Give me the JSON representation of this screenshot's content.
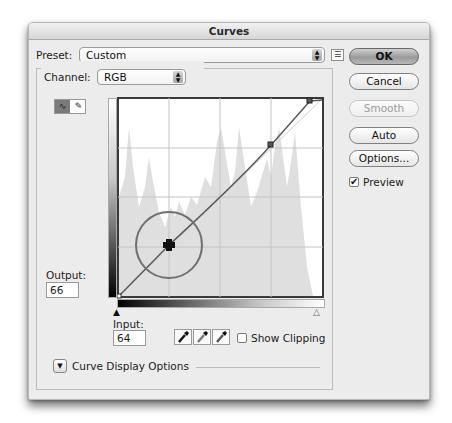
{
  "window": {
    "title": "Curves"
  },
  "preset": {
    "label": "Preset:",
    "value": "Custom",
    "menu_icon": "preset-options-icon"
  },
  "channel": {
    "label": "Channel:",
    "value": "RGB"
  },
  "tools": [
    {
      "name": "curve-edit-tool",
      "glyph": "∿",
      "active": true
    },
    {
      "name": "pencil-tool",
      "glyph": "✎",
      "active": false
    }
  ],
  "buttons": {
    "ok": "OK",
    "cancel": "Cancel",
    "smooth": "Smooth",
    "auto": "Auto",
    "options": "Options..."
  },
  "preview": {
    "label": "Preview",
    "checked": true,
    "glyph": "✔"
  },
  "output": {
    "label": "Output:",
    "value": "66"
  },
  "input": {
    "label": "Input:",
    "value": "64"
  },
  "eyedroppers": [
    {
      "name": "black-point-eyedropper",
      "color": "#111111"
    },
    {
      "name": "gray-point-eyedropper",
      "color": "#777777"
    },
    {
      "name": "white-point-eyedropper",
      "color": "#dddddd"
    }
  ],
  "show_clipping": {
    "label": "Show Clipping",
    "checked": false
  },
  "curve_display_options": {
    "label": "Curve Display Options",
    "glyph": "▼"
  },
  "curve": {
    "points": [
      {
        "input": 0,
        "output": 0
      },
      {
        "input": 64,
        "output": 66,
        "selected": true
      },
      {
        "input": 196,
        "output": 204
      },
      {
        "input": 244,
        "output": 255
      },
      {
        "input": 255,
        "output": 255
      }
    ],
    "grid_divisions": 4
  },
  "sliders": {
    "black_glyph": "▲",
    "white_glyph": "△"
  }
}
